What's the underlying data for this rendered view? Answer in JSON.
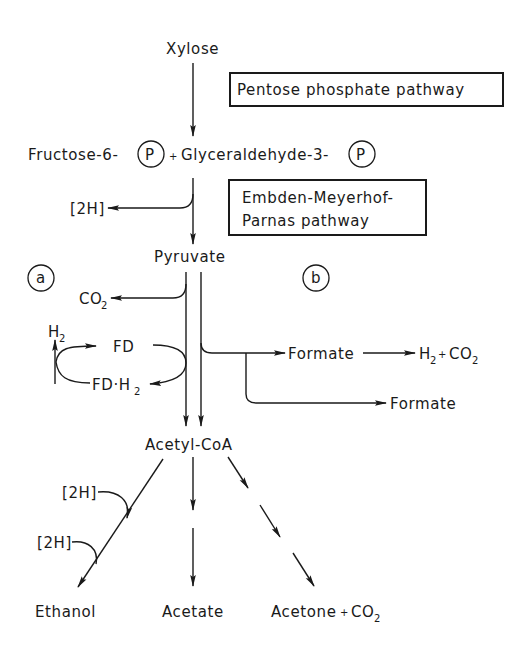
{
  "diagram": {
    "nodes": {
      "xylose": "Xylose",
      "fructose": "Fructose-6-",
      "plus1": "+",
      "glyceraldehyde": "Glyceraldehyde-3-",
      "phosphate_symbol": "P",
      "pyruvate": "Pyruvate",
      "acetyl_coa": "Acetyl-CoA",
      "ethanol": "Ethanol",
      "acetate": "Acetate",
      "acetone": "Acetone",
      "acetone_plus": "+",
      "co2_c": "CO",
      "co2_sub": "2",
      "formate1": "Formate",
      "formate2": "Formate",
      "h2": "H",
      "h2_sub": "2",
      "h2co2_plus": "+",
      "fd": "FD",
      "fdh2_prefix": "FD·H",
      "fdh2_sub": "2"
    },
    "boxes": {
      "pentose": "Pentose phosphate pathway",
      "emp_line1": "Embden-Meyerhof-",
      "emp_line2": "Parnas pathway"
    },
    "cofactors": {
      "h2_top": "[2H]",
      "h2_ethanol_1": "[2H]",
      "h2_ethanol_2": "[2H]"
    },
    "route_labels": {
      "a": "a",
      "b": "b"
    }
  }
}
